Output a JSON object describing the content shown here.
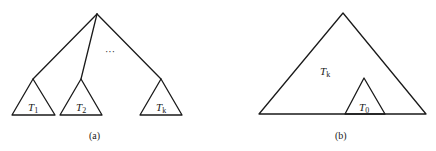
{
  "diagram_a": {
    "caption": "(a)",
    "ellipsis": "···",
    "subtrees": [
      {
        "name": "T",
        "sub": "1"
      },
      {
        "name": "T",
        "sub": "2"
      },
      {
        "name": "T",
        "sub": "k"
      }
    ]
  },
  "diagram_b": {
    "caption": "(b)",
    "outer_tree": {
      "name": "T",
      "sub": "k"
    },
    "inner_tree": {
      "name": "T",
      "sub": "0"
    }
  }
}
